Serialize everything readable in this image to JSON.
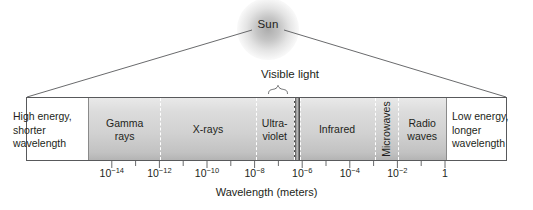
{
  "figure": {
    "sun": {
      "label": "Sun"
    },
    "visible_callout": {
      "label": "Visible light"
    },
    "captions": {
      "left": "High energy,\nshorter\nwavelength",
      "right": "Low energy,\nlonger\nwavelength"
    },
    "axis": {
      "title": "Wavelength (meters)",
      "exponents": [
        "-14",
        "-12",
        "-10",
        "-8",
        "-6",
        "-4",
        "-2",
        ""
      ],
      "tick_labels": [
        "10⁻¹⁴",
        "10⁻¹²",
        "10⁻¹⁰",
        "10⁻⁸",
        "10⁻⁶",
        "10⁻⁴",
        "10⁻²",
        "1"
      ]
    },
    "colors": {
      "ink": "#231f20",
      "frame": "#58595b",
      "bar_light": "#e9e9e9",
      "bar_dark": "#b4b4b4",
      "divider": "#ffffff",
      "visible_dark": "#3a3a3a",
      "visible_light": "#c8c8c8"
    }
  },
  "chart_data": {
    "type": "bar",
    "xlabel": "Wavelength (meters)",
    "ylabel": "",
    "xscale": "log",
    "xlim": [
      1e-15,
      1
    ],
    "grid": false,
    "legend": "none",
    "axis_ticks": [
      {
        "value": 1e-14,
        "label": "10⁻¹⁴",
        "mantissa": "10",
        "exponent": "-14"
      },
      {
        "value": 1e-12,
        "label": "10⁻¹²",
        "mantissa": "10",
        "exponent": "-12"
      },
      {
        "value": 1e-10,
        "label": "10⁻¹⁰",
        "mantissa": "10",
        "exponent": "-10"
      },
      {
        "value": 1e-08,
        "label": "10⁻⁸",
        "mantissa": "10",
        "exponent": "-8"
      },
      {
        "value": 1e-06,
        "label": "10⁻⁶",
        "mantissa": "10",
        "exponent": "-6"
      },
      {
        "value": 0.0001,
        "label": "10⁻⁴",
        "mantissa": "10",
        "exponent": "-4"
      },
      {
        "value": 0.01,
        "label": "10⁻²",
        "mantissa": "10",
        "exponent": "-2"
      },
      {
        "value": 1,
        "label": "1",
        "mantissa": "1",
        "exponent": ""
      }
    ],
    "minor_tick_values": [
      1e-13,
      1e-11,
      1e-09,
      1e-07,
      1e-05,
      0.001,
      0.1
    ],
    "bands": [
      {
        "name": "Gamma rays",
        "label_lines": [
          "Gamma",
          "rays"
        ],
        "range_m": [
          1e-15,
          1e-12
        ],
        "orientation": "horizontal"
      },
      {
        "name": "X-rays",
        "label_lines": [
          "X-rays"
        ],
        "range_m": [
          1e-12,
          1e-08
        ],
        "orientation": "horizontal"
      },
      {
        "name": "Ultraviolet",
        "label_lines": [
          "Ultra-",
          "violet"
        ],
        "range_m": [
          1e-08,
          4e-07
        ],
        "orientation": "horizontal"
      },
      {
        "name": "Visible light",
        "label_lines": [],
        "range_m": [
          4e-07,
          7e-07
        ],
        "orientation": "none"
      },
      {
        "name": "Infrared",
        "label_lines": [
          "Infrared"
        ],
        "range_m": [
          7e-07,
          0.001
        ],
        "orientation": "horizontal"
      },
      {
        "name": "Microwaves",
        "label_lines": [
          "Microwaves"
        ],
        "range_m": [
          0.001,
          0.01
        ],
        "orientation": "vertical"
      },
      {
        "name": "Radio waves",
        "label_lines": [
          "Radio",
          "waves"
        ],
        "range_m": [
          0.01,
          1
        ],
        "orientation": "horizontal"
      }
    ],
    "annotations": [
      {
        "text": "Visible light",
        "target": "visible-band",
        "kind": "brace-callout"
      },
      {
        "text": "Sun",
        "target": "source",
        "kind": "source-label"
      },
      {
        "text": "High energy, shorter wavelength",
        "target": "left-end",
        "kind": "axis-end-note"
      },
      {
        "text": "Low energy, longer wavelength",
        "target": "right-end",
        "kind": "axis-end-note"
      }
    ]
  }
}
